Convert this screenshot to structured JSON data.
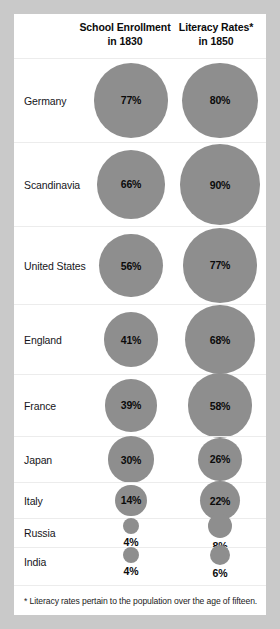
{
  "footnote": "* Literacy rates pertain to the population over the age of fifteen.",
  "chart_data": {
    "type": "bubble",
    "title": "",
    "categories": [
      "Germany",
      "Scandinavia",
      "United States",
      "England",
      "France",
      "Japan",
      "Italy",
      "Russia",
      "India"
    ],
    "columns": [
      {
        "label_line1": "School Enrollment",
        "label_line2": "in 1830"
      },
      {
        "label_line1": "Literacy Rates*",
        "label_line2": "in 1850"
      }
    ],
    "series": [
      {
        "name": "School Enrollment in 1830",
        "values": [
          77,
          66,
          56,
          41,
          39,
          30,
          14,
          4,
          4
        ],
        "value_labels": [
          "77%",
          "66%",
          "56%",
          "41%",
          "39%",
          "30%",
          "14%",
          "4%",
          "4%"
        ]
      },
      {
        "name": "Literacy Rates in 1850",
        "values": [
          80,
          90,
          77,
          68,
          58,
          26,
          22,
          8,
          6
        ],
        "value_labels": [
          "80%",
          "90%",
          "77%",
          "68%",
          "58%",
          "26%",
          "22%",
          "8%",
          "6%"
        ]
      }
    ],
    "units": "percent",
    "encoding": "bubble area proportional to percentage",
    "bubble_color": "#8e8e8e",
    "background": "#ffffff",
    "grid": false,
    "legend": "none"
  }
}
